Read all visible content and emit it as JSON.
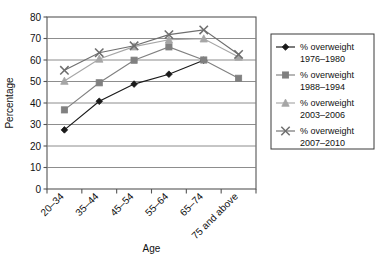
{
  "chart_data": {
    "type": "line",
    "title": "",
    "xlabel": "Age",
    "ylabel": "Percentage",
    "categories": [
      "20–34",
      "35–44",
      "45–54",
      "55–64",
      "65–74",
      "75 and above"
    ],
    "ylim": [
      0,
      80
    ],
    "ytick_step": 10,
    "yticks": [
      "0",
      "10",
      "20",
      "30",
      "40",
      "50",
      "60",
      "70",
      "80"
    ],
    "grid": "horizontal",
    "legend_position": "right",
    "series": [
      {
        "name": "% overweight 1976–1980",
        "label_line1": "% overweight",
        "label_line2": "1976–1980",
        "marker": "diamond",
        "color": "#1a1a1a",
        "values": [
          27.5,
          40.8,
          48.8,
          53.4,
          59.9,
          null
        ]
      },
      {
        "name": "% overweight 1988–1994",
        "label_line1": "% overweight",
        "label_line2": "1988–1994",
        "marker": "square",
        "color": "#808080",
        "values": [
          36.8,
          49.4,
          59.9,
          66.1,
          60.0,
          51.5
        ]
      },
      {
        "name": "% overweight 2003–2006",
        "label_line1": "% overweight",
        "label_line2": "2003–2006",
        "marker": "triangle",
        "color": "#a6a6a6",
        "values": [
          50.2,
          60.5,
          66.2,
          69.4,
          69.9,
          61.4
        ]
      },
      {
        "name": "% overweight 2007–2010",
        "label_line1": "% overweight",
        "label_line2": "2007–2010",
        "marker": "x",
        "color": "#6e6e6e",
        "values": [
          55.2,
          63.4,
          66.6,
          71.8,
          74.0,
          62.6
        ]
      }
    ]
  },
  "colors": {
    "series1": "#1a1a1a",
    "series2": "#808080",
    "series3": "#a6a6a6",
    "series4": "#6e6e6e",
    "grid": "#808080",
    "axis": "#555555",
    "background": "#ffffff"
  }
}
